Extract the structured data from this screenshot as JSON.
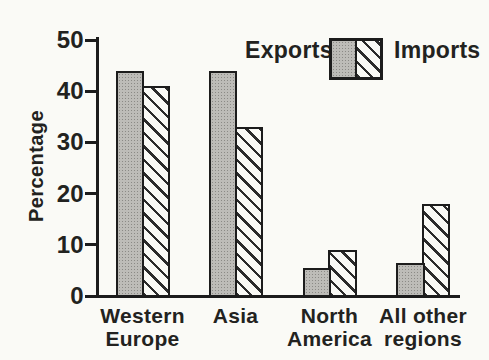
{
  "chart_data": {
    "type": "bar",
    "title": "",
    "xlabel": "",
    "ylabel": "Percentage",
    "ylim": [
      0,
      50
    ],
    "yticks": [
      0,
      10,
      20,
      30,
      40,
      50
    ],
    "categories": [
      "Western Europe",
      "Asia",
      "North America",
      "All other regions"
    ],
    "categories_display": [
      "Western\nEurope",
      "Asia",
      "North\nAmerica",
      "All other\nregions"
    ],
    "series": [
      {
        "name": "Exports",
        "values": [
          44,
          44,
          5.5,
          6.5
        ]
      },
      {
        "name": "Imports",
        "values": [
          41,
          33,
          9,
          18
        ]
      }
    ],
    "grid": false,
    "legend_position": "top-right"
  },
  "legend": {
    "exports_label": "Exports",
    "imports_label": "Imports"
  },
  "colors": {
    "background": "#fafaf6",
    "axis": "#1c1c1c",
    "text": "#222220",
    "exports_fill": "#bdbcb8",
    "exports_dot": "#8b8a86",
    "imports_fill": "#f9f9f5",
    "hatch_line": "#2b2b2b"
  }
}
